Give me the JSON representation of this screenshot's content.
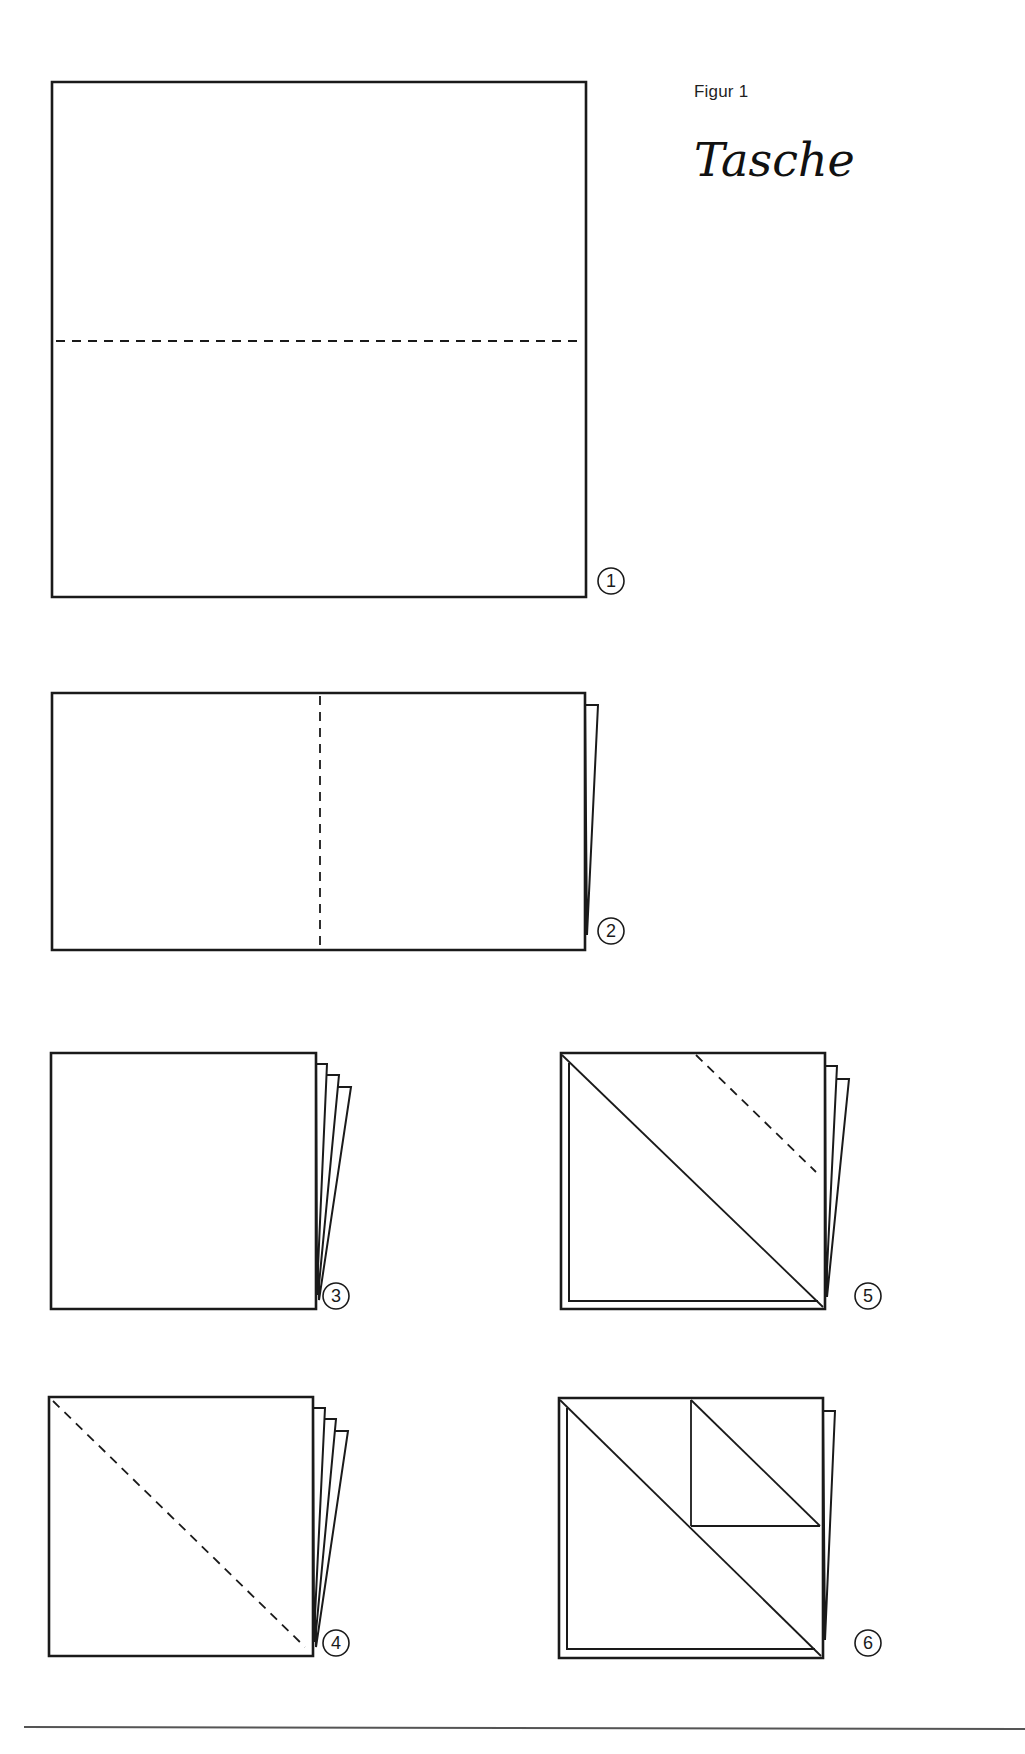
{
  "header": {
    "caption": "Figur 1",
    "title": "Tasche"
  },
  "style": {
    "ink": "#1a1a1a",
    "paper": "#ffffff",
    "rule": "#555555"
  },
  "steps": [
    {
      "number": "1",
      "label_pos": [
        611,
        581
      ],
      "outline": [
        [
          52,
          82
        ],
        [
          586,
          82
        ],
        [
          586,
          597
        ],
        [
          52,
          597
        ]
      ],
      "sheets": [],
      "inner_frame": null,
      "solid_lines": [],
      "dashed_lines": [
        [
          [
            56,
            341
          ],
          [
            582,
            341
          ]
        ]
      ]
    },
    {
      "number": "2",
      "label_pos": [
        611,
        931
      ],
      "outline": [
        [
          52,
          693
        ],
        [
          585,
          693
        ],
        [
          585,
          950
        ],
        [
          52,
          950
        ]
      ],
      "sheets": [
        [
          [
            585,
            705
          ],
          [
            598,
            705
          ],
          [
            587,
            935
          ]
        ]
      ],
      "inner_frame": null,
      "solid_lines": [],
      "dashed_lines": [
        [
          [
            320,
            696
          ],
          [
            320,
            947
          ]
        ]
      ]
    },
    {
      "number": "3",
      "label_pos": [
        336,
        1296
      ],
      "outline": [
        [
          51,
          1053
        ],
        [
          316,
          1053
        ],
        [
          316,
          1309
        ],
        [
          51,
          1309
        ]
      ],
      "sheets": [
        [
          [
            316,
            1064
          ],
          [
            327,
            1064
          ],
          [
            317,
            1290
          ]
        ],
        [
          [
            317,
            1075
          ],
          [
            339,
            1075
          ],
          [
            318,
            1295
          ]
        ],
        [
          [
            318,
            1087
          ],
          [
            351,
            1087
          ],
          [
            319,
            1300
          ]
        ]
      ],
      "inner_frame": null,
      "solid_lines": [],
      "dashed_lines": []
    },
    {
      "number": "4",
      "label_pos": [
        336,
        1643
      ],
      "outline": [
        [
          49,
          1397
        ],
        [
          313,
          1397
        ],
        [
          313,
          1656
        ],
        [
          49,
          1656
        ]
      ],
      "sheets": [
        [
          [
            313,
            1408
          ],
          [
            325,
            1408
          ],
          [
            314,
            1636
          ]
        ],
        [
          [
            314,
            1419
          ],
          [
            336,
            1419
          ],
          [
            315,
            1642
          ]
        ],
        [
          [
            315,
            1431
          ],
          [
            348,
            1431
          ],
          [
            316,
            1647
          ]
        ]
      ],
      "inner_frame": null,
      "solid_lines": [],
      "dashed_lines": [
        [
          [
            53,
            1401
          ],
          [
            305,
            1647
          ]
        ]
      ]
    },
    {
      "number": "5",
      "label_pos": [
        868,
        1296
      ],
      "outline": [
        [
          561,
          1053
        ],
        [
          825,
          1053
        ],
        [
          825,
          1309
        ],
        [
          561,
          1309
        ]
      ],
      "sheets": [
        [
          [
            825,
            1066
          ],
          [
            837,
            1066
          ],
          [
            826,
            1290
          ]
        ],
        [
          [
            826,
            1079
          ],
          [
            849,
            1079
          ],
          [
            827,
            1297
          ]
        ]
      ],
      "inner_frame": [
        [
          569,
          1063
        ],
        [
          569,
          1301
        ],
        [
          818,
          1301
        ]
      ],
      "solid_lines": [
        [
          [
            562,
            1055
          ],
          [
            823,
            1307
          ]
        ]
      ],
      "dashed_lines": [
        [
          [
            696,
            1055
          ],
          [
            816,
            1172
          ]
        ]
      ]
    },
    {
      "number": "6",
      "label_pos": [
        868,
        1643
      ],
      "outline": [
        [
          559,
          1398
        ],
        [
          823,
          1398
        ],
        [
          823,
          1658
        ],
        [
          559,
          1658
        ]
      ],
      "sheets": [
        [
          [
            823,
            1411
          ],
          [
            835,
            1411
          ],
          [
            825,
            1640
          ]
        ]
      ],
      "inner_frame": [
        [
          567,
          1408
        ],
        [
          567,
          1649
        ],
        [
          815,
          1649
        ]
      ],
      "solid_lines": [
        [
          [
            560,
            1400
          ],
          [
            821,
            1656
          ]
        ],
        [
          [
            691,
            1400
          ],
          [
            820,
            1526
          ]
        ],
        [
          [
            691,
            1400
          ],
          [
            691,
            1526
          ]
        ],
        [
          [
            691,
            1526
          ],
          [
            820,
            1526
          ]
        ]
      ],
      "dashed_lines": []
    }
  ],
  "footer": {
    "rule": [
      [
        24,
        1727
      ],
      [
        1025,
        1729
      ]
    ]
  }
}
